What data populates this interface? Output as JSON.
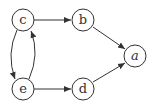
{
  "diagram": {
    "type": "directed-graph",
    "nodes": [
      {
        "id": "c",
        "label": "c",
        "x": 23,
        "y": 20,
        "italic": false
      },
      {
        "id": "b",
        "label": "b",
        "x": 83,
        "y": 20,
        "italic": false
      },
      {
        "id": "a",
        "label": "a",
        "x": 135,
        "y": 56,
        "italic": true
      },
      {
        "id": "e",
        "label": "e",
        "x": 23,
        "y": 89,
        "italic": false
      },
      {
        "id": "d",
        "label": "d",
        "x": 83,
        "y": 89,
        "italic": false
      }
    ],
    "edges": [
      {
        "from": "c",
        "to": "b"
      },
      {
        "from": "b",
        "to": "a"
      },
      {
        "from": "c",
        "to": "e",
        "curved": "left"
      },
      {
        "from": "e",
        "to": "c",
        "curved": "right"
      },
      {
        "from": "e",
        "to": "d"
      },
      {
        "from": "d",
        "to": "a"
      }
    ],
    "colors": {
      "stroke": "#333333",
      "fill": "#ffffff"
    }
  }
}
